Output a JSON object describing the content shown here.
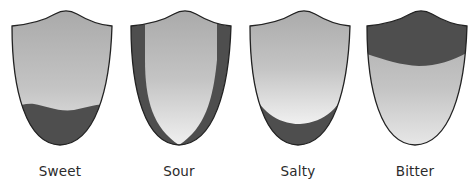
{
  "colors": {
    "light_gray_top": "#a9a9a9",
    "light_gray_bottom": "#ececec",
    "dark_region": "#4e4e4e",
    "outline": "#222222",
    "label": "#2b2b2b"
  },
  "tongues": [
    {
      "label": "Sweet",
      "region": "tip"
    },
    {
      "label": "Sour",
      "region": "sides"
    },
    {
      "label": "Salty",
      "region": "front-sides"
    },
    {
      "label": "Bitter",
      "region": "back"
    }
  ]
}
